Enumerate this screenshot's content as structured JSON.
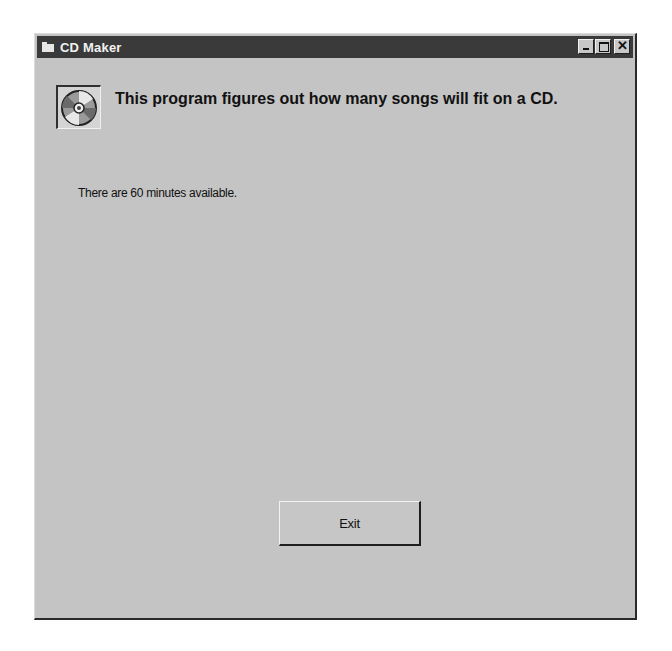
{
  "window": {
    "title": "CD Maker",
    "title_icon": "folder-icon",
    "controls": {
      "minimize": "minimize-icon",
      "maximize": "maximize-icon",
      "close": "close-icon"
    }
  },
  "content": {
    "icon": "cd-disc-icon",
    "heading": "This program figures out how many songs will fit on a CD.",
    "info": "There are 60 minutes available."
  },
  "buttons": {
    "exit_label": "Exit"
  },
  "colors": {
    "titlebar": "#3a3a3a",
    "window_bg": "#c4c4c4",
    "text": "#111111"
  }
}
